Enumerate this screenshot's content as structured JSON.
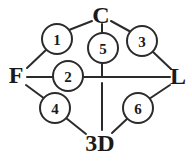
{
  "diagram": {
    "type": "node-link-graph",
    "background_color": "#ffffff",
    "stroke_color": "#2b2b2b",
    "text_color": "#1a1a1a",
    "terminals": [
      {
        "id": "C",
        "label": "C",
        "x": 101,
        "y": 15,
        "position": "top"
      },
      {
        "id": "F",
        "label": "F",
        "x": 16,
        "y": 75,
        "position": "left"
      },
      {
        "id": "L",
        "label": "L",
        "x": 178,
        "y": 76,
        "position": "right"
      },
      {
        "id": "3D",
        "label": "3D",
        "x": 100,
        "y": 143,
        "position": "bottom"
      }
    ],
    "nodes": [
      {
        "id": "n1",
        "label": "1",
        "cx": 57,
        "cy": 39,
        "r": 15
      },
      {
        "id": "n5",
        "label": "5",
        "cx": 103,
        "cy": 48,
        "r": 15
      },
      {
        "id": "n3",
        "label": "3",
        "cx": 142,
        "cy": 41,
        "r": 15
      },
      {
        "id": "n2",
        "label": "2",
        "cx": 68,
        "cy": 76,
        "r": 15
      },
      {
        "id": "n4",
        "label": "4",
        "cx": 55,
        "cy": 108,
        "r": 15
      },
      {
        "id": "n6",
        "label": "6",
        "cx": 138,
        "cy": 108,
        "r": 15
      }
    ],
    "edges": [
      {
        "id": "e-c-n1",
        "from": "C",
        "to": "n1",
        "x1": 92,
        "y1": 21,
        "x2": 69,
        "y2": 30
      },
      {
        "id": "e-n1-f",
        "from": "n1",
        "to": "F",
        "x1": 46,
        "y1": 50,
        "x2": 27,
        "y2": 68
      },
      {
        "id": "e-c-n3",
        "from": "C",
        "to": "n3",
        "x1": 111,
        "y1": 21,
        "x2": 131,
        "y2": 32
      },
      {
        "id": "e-n3-l",
        "from": "n3",
        "to": "L",
        "x1": 152,
        "y1": 51,
        "x2": 171,
        "y2": 69
      },
      {
        "id": "e-f-n2",
        "from": "F",
        "to": "n2",
        "x1": 27,
        "y1": 77,
        "x2": 53,
        "y2": 77
      },
      {
        "id": "e-n2-l",
        "from": "n2",
        "to": "L",
        "x1": 83,
        "y1": 77,
        "x2": 170,
        "y2": 77
      },
      {
        "id": "e-f-n4",
        "from": "F",
        "to": "n4",
        "x1": 26,
        "y1": 85,
        "x2": 45,
        "y2": 99
      },
      {
        "id": "e-n4-3d",
        "from": "n4",
        "to": "3D",
        "x1": 66,
        "y1": 118,
        "x2": 86,
        "y2": 134
      },
      {
        "id": "e-l-n6",
        "from": "L",
        "to": "n6",
        "x1": 170,
        "y1": 85,
        "x2": 149,
        "y2": 99
      },
      {
        "id": "e-n6-3d",
        "from": "n6",
        "to": "3D",
        "x1": 128,
        "y1": 118,
        "x2": 112,
        "y2": 133
      },
      {
        "id": "e-c-n5",
        "from": "C",
        "to": "n5",
        "x1": 102,
        "y1": 24,
        "x2": 102,
        "y2": 34
      },
      {
        "id": "e-n5-mid",
        "from": "n5",
        "to": "mid",
        "x1": 102,
        "y1": 62,
        "x2": 102,
        "y2": 77
      },
      {
        "id": "e-mid-3d",
        "from": "mid",
        "to": "3D",
        "x1": 102,
        "y1": 83,
        "x2": 102,
        "y2": 130
      }
    ]
  }
}
